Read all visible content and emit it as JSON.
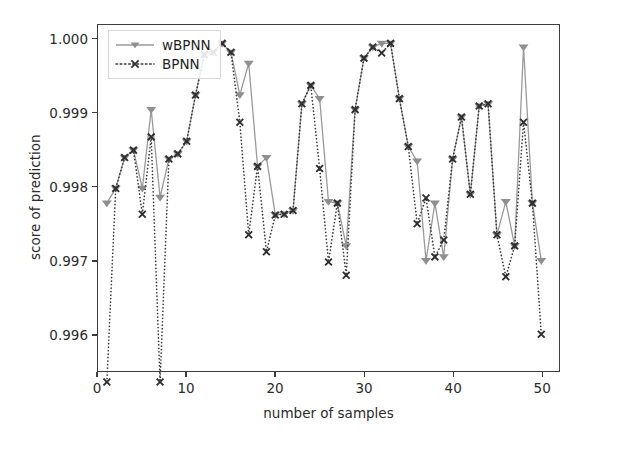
{
  "chart_data": {
    "type": "line",
    "title": "",
    "xlabel": "number of samples",
    "ylabel": "score of prediction",
    "xlim": [
      0,
      52
    ],
    "ylim": [
      0.9955,
      1.0002
    ],
    "grid": false,
    "legend_position": "upper left",
    "xticks": [
      0,
      10,
      20,
      30,
      40,
      50
    ],
    "xtick_labels": [
      "0",
      "10",
      "20",
      "30",
      "40",
      "50"
    ],
    "yticks": [
      0.996,
      0.997,
      0.998,
      0.999,
      1.0
    ],
    "ytick_labels": [
      "0.996",
      "0.997",
      "0.998",
      "0.999",
      "1.000"
    ],
    "x": [
      1,
      2,
      3,
      4,
      5,
      6,
      7,
      8,
      9,
      10,
      11,
      12,
      13,
      14,
      15,
      16,
      17,
      18,
      19,
      20,
      21,
      22,
      23,
      24,
      25,
      26,
      27,
      28,
      29,
      30,
      31,
      32,
      33,
      34,
      35,
      36,
      37,
      38,
      39,
      40,
      41,
      42,
      43,
      44,
      45,
      46,
      47,
      48,
      49,
      50
    ],
    "series": [
      {
        "name": "wBPNN",
        "color": "#9a9a9a",
        "marker": "triangle-down",
        "marker_color": "#8f8f8f",
        "linestyle": "solid",
        "values": [
          0.99778,
          0.99798,
          0.9984,
          0.9985,
          0.99798,
          0.99905,
          0.99786,
          0.99838,
          0.99845,
          0.99862,
          0.99925,
          0.9998,
          0.99983,
          0.99995,
          0.99983,
          0.99925,
          0.99968,
          0.99828,
          0.9984,
          0.99762,
          0.99763,
          0.99768,
          0.99913,
          0.99938,
          0.9992,
          0.9978,
          0.99778,
          0.9972,
          0.99905,
          0.99975,
          0.9999,
          0.99995,
          0.99995,
          0.9992,
          0.99855,
          0.99835,
          0.997,
          0.99778,
          0.99705,
          0.99838,
          0.99895,
          0.9979,
          0.9991,
          0.99913,
          0.99735,
          0.9978,
          0.9972,
          0.9999,
          0.99778,
          0.997
        ]
      },
      {
        "name": "BPNN",
        "color": "#3a3a3a",
        "marker": "x",
        "marker_color": "#2f2f2f",
        "linestyle": "dotted",
        "values": [
          0.99535,
          0.99798,
          0.9984,
          0.9985,
          0.99763,
          0.99868,
          0.99535,
          0.99838,
          0.99845,
          0.99862,
          0.99925,
          0.9998,
          0.99983,
          0.99995,
          0.99983,
          0.99888,
          0.99735,
          0.99828,
          0.99712,
          0.99762,
          0.99763,
          0.99768,
          0.99913,
          0.99938,
          0.99825,
          0.99698,
          0.99778,
          0.9968,
          0.99905,
          0.99975,
          0.9999,
          0.99982,
          0.99995,
          0.9992,
          0.99855,
          0.9975,
          0.99785,
          0.99705,
          0.99728,
          0.99838,
          0.99895,
          0.9979,
          0.9991,
          0.99913,
          0.99735,
          0.99678,
          0.9972,
          0.99888,
          0.99778,
          0.996
        ]
      }
    ]
  },
  "legend": {
    "entries": [
      {
        "label": "wBPNN"
      },
      {
        "label": "BPNN"
      }
    ]
  },
  "axes": {
    "ylabel": "score of prediction",
    "xlabel": "number of samples"
  },
  "colors": {
    "wbpnn": "#9a9a9a",
    "bpnn": "#3a3a3a",
    "axis": "#3d3d3d",
    "text": "#2b2b2b",
    "background": "#ffffff"
  }
}
